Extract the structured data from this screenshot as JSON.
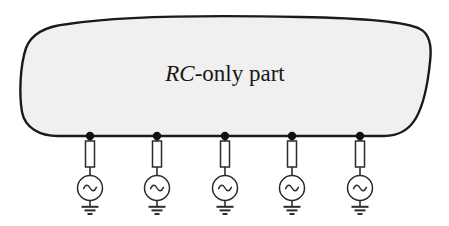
{
  "figure": {
    "kind": "circuit-diagram",
    "width": 449,
    "height": 226,
    "background_color": "#ffffff"
  },
  "blob": {
    "label_italic": "RC",
    "label_roman": "-only part",
    "label_full": "RC-only part",
    "fill_color": "#f0f0f0",
    "stroke_color": "#1a1a1a",
    "stroke_width": 2.4
  },
  "branches": [
    {
      "index": 1,
      "node_x": 90,
      "node_label": "",
      "resistor_label": "",
      "source_symbol": "ac-source",
      "ground_symbol": "earth-ground"
    },
    {
      "index": 2,
      "node_x": 157,
      "node_label": "",
      "resistor_label": "",
      "source_symbol": "ac-source",
      "ground_symbol": "earth-ground"
    },
    {
      "index": 3,
      "node_x": 225,
      "node_label": "",
      "resistor_label": "",
      "source_symbol": "ac-source",
      "ground_symbol": "earth-ground"
    },
    {
      "index": 4,
      "node_x": 292,
      "node_label": "",
      "resistor_label": "",
      "source_symbol": "ac-source",
      "ground_symbol": "earth-ground"
    },
    {
      "index": 5,
      "node_x": 360,
      "node_label": "",
      "resistor_label": "",
      "source_symbol": "ac-source",
      "ground_symbol": "earth-ground"
    }
  ],
  "geometry": {
    "node_dot_radius": 4.2,
    "node_y": 136,
    "resistor_top": 141,
    "resistor_bottom": 167,
    "resistor_width": 9,
    "source_center_y": 188,
    "source_radius": 12.5,
    "ground_top_y": 206,
    "ground_bar_widths": [
      17,
      11,
      5
    ],
    "ground_bar_gap": 3.6
  },
  "colors": {
    "wire": "#2b2b2b",
    "component_stroke": "#2b2b2b",
    "component_fill": "#ffffff",
    "node_fill": "#111111",
    "blob_fill": "#f0f0f0",
    "blob_stroke": "#1a1a1a",
    "text": "#171717"
  }
}
